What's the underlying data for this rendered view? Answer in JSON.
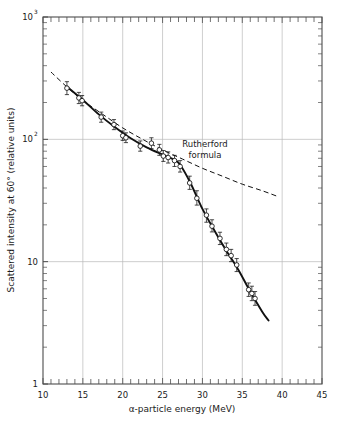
{
  "chart_data": {
    "type": "scatter",
    "title": "",
    "xlabel": "α-particle energy (MeV)",
    "ylabel": "Scattered intensity at 60° (relative units)",
    "xlim": [
      10,
      45
    ],
    "ylim": [
      1,
      1000
    ],
    "yscale": "log",
    "xscale": "linear",
    "grid": true,
    "legend": "none",
    "xticks": [
      10,
      15,
      20,
      25,
      30,
      35,
      40,
      45
    ],
    "xticklabels": [
      "10",
      "15",
      "20",
      "25",
      "30",
      "35",
      "40",
      "45"
    ],
    "xminor_step": 1,
    "yticks": [
      1,
      10,
      100,
      1000
    ],
    "yticklabels": [
      "1",
      "10",
      "10",
      "10"
    ],
    "ytick_display": [
      {
        "value": 1,
        "mantissa": "1",
        "exponent": ""
      },
      {
        "value": 10,
        "mantissa": "10",
        "exponent": ""
      },
      {
        "value": 100,
        "mantissa": "10",
        "exponent": "2"
      },
      {
        "value": 1000,
        "mantissa": "10",
        "exponent": "3"
      }
    ],
    "annotations": [
      {
        "name": "rutherford-label",
        "line1": "Rutherford",
        "line2": "formula",
        "x": 30.4,
        "y": 120
      }
    ],
    "series": [
      {
        "name": "measured-data",
        "style": "open-circles-with-errorbars",
        "points": [
          {
            "x": 13.0,
            "y": 262,
            "yerr_lo": 232,
            "yerr_hi": 296
          },
          {
            "x": 14.5,
            "y": 218,
            "yerr_lo": 196,
            "yerr_hi": 242
          },
          {
            "x": 14.9,
            "y": 207,
            "yerr_lo": 188,
            "yerr_hi": 228
          },
          {
            "x": 17.3,
            "y": 152,
            "yerr_lo": 138,
            "yerr_hi": 167
          },
          {
            "x": 18.9,
            "y": 132,
            "yerr_lo": 120,
            "yerr_hi": 145
          },
          {
            "x": 20.0,
            "y": 107,
            "yerr_lo": 98,
            "yerr_hi": 117
          },
          {
            "x": 20.4,
            "y": 103,
            "yerr_lo": 94,
            "yerr_hi": 113
          },
          {
            "x": 22.2,
            "y": 88,
            "yerr_lo": 80,
            "yerr_hi": 97
          },
          {
            "x": 23.6,
            "y": 93,
            "yerr_lo": 84,
            "yerr_hi": 103
          },
          {
            "x": 24.6,
            "y": 82,
            "yerr_lo": 74,
            "yerr_hi": 91
          },
          {
            "x": 25.1,
            "y": 73,
            "yerr_lo": 66,
            "yerr_hi": 81
          },
          {
            "x": 25.7,
            "y": 71,
            "yerr_lo": 64,
            "yerr_hi": 79
          },
          {
            "x": 26.5,
            "y": 67,
            "yerr_lo": 60,
            "yerr_hi": 74
          },
          {
            "x": 27.2,
            "y": 60,
            "yerr_lo": 54,
            "yerr_hi": 67
          },
          {
            "x": 28.4,
            "y": 44,
            "yerr_lo": 39,
            "yerr_hi": 50
          },
          {
            "x": 29.3,
            "y": 33,
            "yerr_lo": 29,
            "yerr_hi": 38
          },
          {
            "x": 30.5,
            "y": 24,
            "yerr_lo": 21,
            "yerr_hi": 27
          },
          {
            "x": 31.2,
            "y": 19.5,
            "yerr_lo": 17.5,
            "yerr_hi": 22
          },
          {
            "x": 32.2,
            "y": 15.5,
            "yerr_lo": 13.8,
            "yerr_hi": 17.4
          },
          {
            "x": 33.0,
            "y": 12.6,
            "yerr_lo": 11.2,
            "yerr_hi": 14.2
          },
          {
            "x": 33.6,
            "y": 11.2,
            "yerr_lo": 10.0,
            "yerr_hi": 12.6
          },
          {
            "x": 34.3,
            "y": 9.4,
            "yerr_lo": 8.3,
            "yerr_hi": 10.6
          },
          {
            "x": 35.8,
            "y": 5.9,
            "yerr_lo": 5.2,
            "yerr_hi": 6.7
          },
          {
            "x": 36.2,
            "y": 5.5,
            "yerr_lo": 4.8,
            "yerr_hi": 6.3
          },
          {
            "x": 36.6,
            "y": 5.0,
            "yerr_lo": 4.4,
            "yerr_hi": 5.7
          }
        ]
      },
      {
        "name": "fit-curve",
        "style": "solid-line",
        "points": [
          {
            "x": 13.0,
            "y": 270
          },
          {
            "x": 15.0,
            "y": 210
          },
          {
            "x": 17.0,
            "y": 160
          },
          {
            "x": 19.0,
            "y": 126
          },
          {
            "x": 21.0,
            "y": 102
          },
          {
            "x": 23.0,
            "y": 86
          },
          {
            "x": 25.0,
            "y": 75
          },
          {
            "x": 26.5,
            "y": 68
          },
          {
            "x": 27.2,
            "y": 62
          },
          {
            "x": 28.5,
            "y": 44
          },
          {
            "x": 30.0,
            "y": 27
          },
          {
            "x": 31.5,
            "y": 18
          },
          {
            "x": 33.0,
            "y": 12.3
          },
          {
            "x": 34.5,
            "y": 8.6
          },
          {
            "x": 36.0,
            "y": 5.7
          },
          {
            "x": 37.5,
            "y": 3.9
          },
          {
            "x": 38.3,
            "y": 3.3
          }
        ]
      },
      {
        "name": "rutherford-formula-curve",
        "style": "dashed-line",
        "points": [
          {
            "x": 11.0,
            "y": 355
          },
          {
            "x": 13.0,
            "y": 268
          },
          {
            "x": 15.0,
            "y": 208
          },
          {
            "x": 17.5,
            "y": 160
          },
          {
            "x": 20.0,
            "y": 124
          },
          {
            "x": 22.5,
            "y": 100
          },
          {
            "x": 25.0,
            "y": 82
          },
          {
            "x": 27.5,
            "y": 69
          },
          {
            "x": 30.0,
            "y": 58
          },
          {
            "x": 32.5,
            "y": 50
          },
          {
            "x": 35.0,
            "y": 43
          },
          {
            "x": 37.5,
            "y": 38
          },
          {
            "x": 39.5,
            "y": 34
          }
        ]
      }
    ]
  },
  "colors": {
    "axis": "#4d4d4d",
    "grid": "#b9b9b9",
    "data": "#111111",
    "text": "#1a1a1a",
    "background": "#ffffff"
  }
}
